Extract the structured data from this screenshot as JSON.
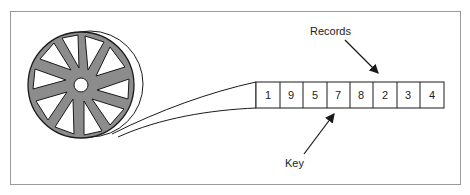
{
  "diagram": {
    "type": "magnetic-tape-sequential-file",
    "labels": {
      "records": "Records",
      "key": "Key"
    },
    "records": [
      "1",
      "9",
      "5",
      "7",
      "8",
      "2",
      "3",
      "4"
    ],
    "colors": {
      "reel_fill": "#8c8c8c",
      "stroke": "#1a1a1a",
      "frame": "#9a9a9a",
      "background": "#ffffff"
    }
  }
}
